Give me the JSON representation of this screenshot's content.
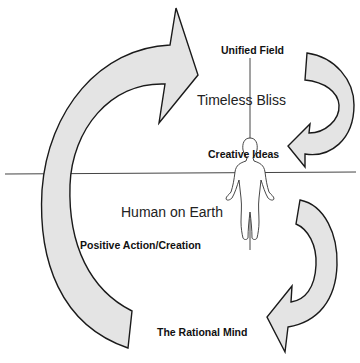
{
  "diagram": {
    "colors": {
      "background": "#ffffff",
      "arrow_fill": "#e4e4e4",
      "stroke": "#1a1a1a",
      "axis_line": "#444444"
    },
    "labels": {
      "unified_field": "Unified Field",
      "timeless_bliss": "Timeless Bliss",
      "creative_ideas": "Creative Ideas",
      "human_on_earth": "Human on Earth",
      "positive_action": "Positive Action/Creation",
      "rational_mind": "The Rational Mind"
    },
    "elements": {
      "large_arrow": "Large curved arrow sweeping up from bottom-left to top",
      "upper_right_arrow": "Curved arrow descending from Unified Field toward Creative Ideas",
      "lower_right_arrow": "Curved arrow descending toward The Rational Mind",
      "horizontal_line": "Horizon line separating spiritual and earthly planes",
      "vertical_line": "Vertical axis through the human figure",
      "human_figure": "Outline of a standing human body"
    }
  }
}
